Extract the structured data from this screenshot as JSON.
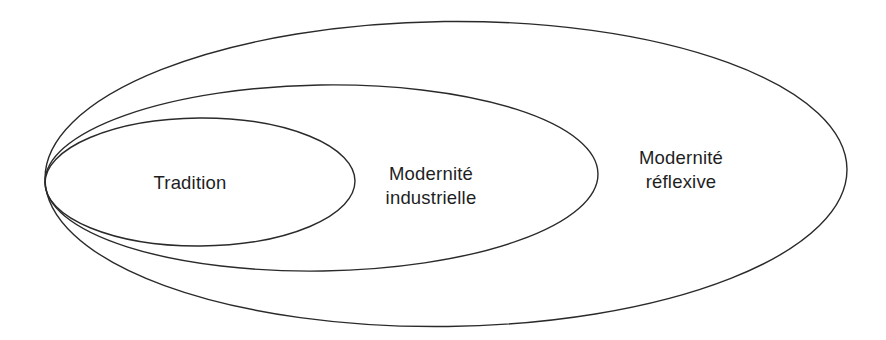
{
  "diagram": {
    "type": "nested-ellipses",
    "stroke_color": "#2a2a2a",
    "text_color": "#1e1e1e",
    "background": "#ffffff",
    "rings": [
      {
        "id": "tradition",
        "lines": [
          "Tradition"
        ],
        "level": 1
      },
      {
        "id": "modernite-industrielle",
        "lines": [
          "Modernité",
          "industrielle"
        ],
        "level": 2
      },
      {
        "id": "modernite-reflexive",
        "lines": [
          "Modernité",
          "réflexive"
        ],
        "level": 3
      }
    ]
  }
}
